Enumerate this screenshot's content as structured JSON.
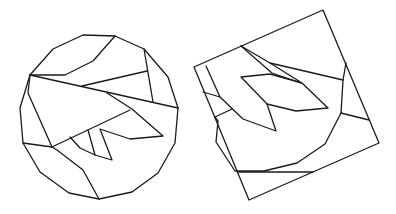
{
  "canvas": {
    "width": 396,
    "height": 214,
    "background": "#ffffff",
    "stroke": "#1a1a1a"
  },
  "figures": [
    {
      "id": "left-dissected-circle",
      "description": "Polygonal approximation of a circle dissected into pieces",
      "polylines": [
        [
          [
            83,
            35
          ],
          [
            115,
            36
          ],
          [
            144,
            49
          ],
          [
            168,
            77
          ],
          [
            178,
            108
          ],
          [
            175,
            143
          ],
          [
            158,
            173
          ],
          [
            132,
            192
          ],
          [
            99,
            199
          ],
          [
            69,
            193
          ],
          [
            40,
            172
          ],
          [
            23,
            143
          ],
          [
            20,
            108
          ],
          [
            30,
            75
          ],
          [
            53,
            49
          ],
          [
            83,
            35
          ]
        ],
        [
          [
            30,
            75
          ],
          [
            65,
            75
          ],
          [
            93,
            61
          ],
          [
            115,
            36
          ]
        ],
        [
          [
            30,
            75
          ],
          [
            178,
            108
          ]
        ],
        [
          [
            144,
            49
          ],
          [
            153,
            102
          ]
        ],
        [
          [
            82,
            86
          ],
          [
            147,
            71
          ]
        ],
        [
          [
            30,
            75
          ],
          [
            28,
            93
          ],
          [
            52,
            147
          ]
        ],
        [
          [
            23,
            143
          ],
          [
            52,
            147
          ]
        ],
        [
          [
            52,
            147
          ],
          [
            130,
            110
          ]
        ],
        [
          [
            107,
            93
          ],
          [
            132,
            109
          ],
          [
            163,
            136
          ],
          [
            130,
            139
          ],
          [
            100,
            129
          ],
          [
            112,
            160
          ],
          [
            95,
            155
          ],
          [
            80,
            148
          ],
          [
            70,
            137
          ]
        ],
        [
          [
            88,
            130
          ],
          [
            95,
            155
          ]
        ],
        [
          [
            52,
            147
          ],
          [
            57,
            150
          ],
          [
            83,
            170
          ],
          [
            99,
            199
          ]
        ]
      ]
    },
    {
      "id": "right-dissected-square",
      "description": "Tilted square with the same pieces rearranged",
      "polylines": [
        [
          [
            194,
            67
          ],
          [
            323,
            10
          ],
          [
            379,
            143
          ],
          [
            249,
            200
          ],
          [
            194,
            67
          ]
        ],
        [
          [
            241,
            46
          ],
          [
            272,
            73
          ],
          [
            301,
            83
          ]
        ],
        [
          [
            241,
            46
          ],
          [
            270,
            63
          ],
          [
            302,
            83
          ],
          [
            328,
            108
          ],
          [
            296,
            111
          ],
          [
            267,
            104
          ],
          [
            241,
            77
          ],
          [
            270,
            74
          ],
          [
            302,
            83
          ]
        ],
        [
          [
            206,
            66
          ],
          [
            220,
            97
          ],
          [
            243,
            119
          ],
          [
            276,
            131
          ],
          [
            267,
            104
          ]
        ],
        [
          [
            270,
            63
          ],
          [
            343,
            80
          ]
        ],
        [
          [
            346,
            63
          ],
          [
            343,
            80
          ],
          [
            341,
            113
          ],
          [
            325,
            144
          ],
          [
            297,
            163
          ],
          [
            264,
            171
          ],
          [
            235,
            171
          ],
          [
            216,
            142
          ],
          [
            218,
            121
          ],
          [
            215,
            117
          ]
        ],
        [
          [
            341,
            113
          ],
          [
            369,
            120
          ]
        ],
        [
          [
            203,
            92
          ],
          [
            220,
            97
          ]
        ],
        [
          [
            215,
            117
          ],
          [
            232,
            109
          ]
        ],
        [
          [
            238,
            172
          ],
          [
            313,
            172
          ]
        ]
      ]
    }
  ]
}
